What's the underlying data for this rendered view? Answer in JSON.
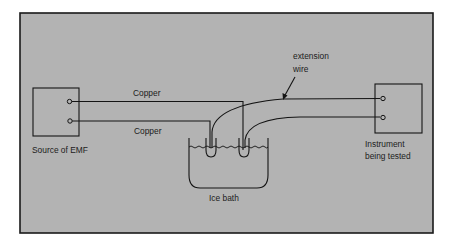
{
  "diagram": {
    "background_color": "#b3b3b3",
    "frame_color": "#1a1a1a",
    "labels": {
      "source": "Source of EMF",
      "copper_top": "Copper",
      "copper_bottom": "Copper",
      "extension_line1": "extension",
      "extension_line2": "wire",
      "instrument_line1": "Instrument",
      "instrument_line2": "being tested",
      "ice_bath": "Ice bath"
    },
    "components": [
      {
        "id": "source",
        "name": "Source of EMF",
        "terminals": 2
      },
      {
        "id": "ice-bath",
        "name": "Ice bath",
        "junctions": 2
      },
      {
        "id": "instrument",
        "name": "Instrument being tested",
        "terminals": 2
      }
    ],
    "connections": [
      {
        "from": "source terminal 1",
        "to": "ice bath junction 2",
        "wire": "Copper"
      },
      {
        "from": "source terminal 2",
        "to": "ice bath junction 1",
        "wire": "Copper"
      },
      {
        "from": "ice bath junction 1",
        "to": "instrument terminal 1",
        "wire": "extension wire"
      },
      {
        "from": "ice bath junction 2",
        "to": "instrument terminal 2",
        "wire": "extension wire"
      }
    ]
  }
}
